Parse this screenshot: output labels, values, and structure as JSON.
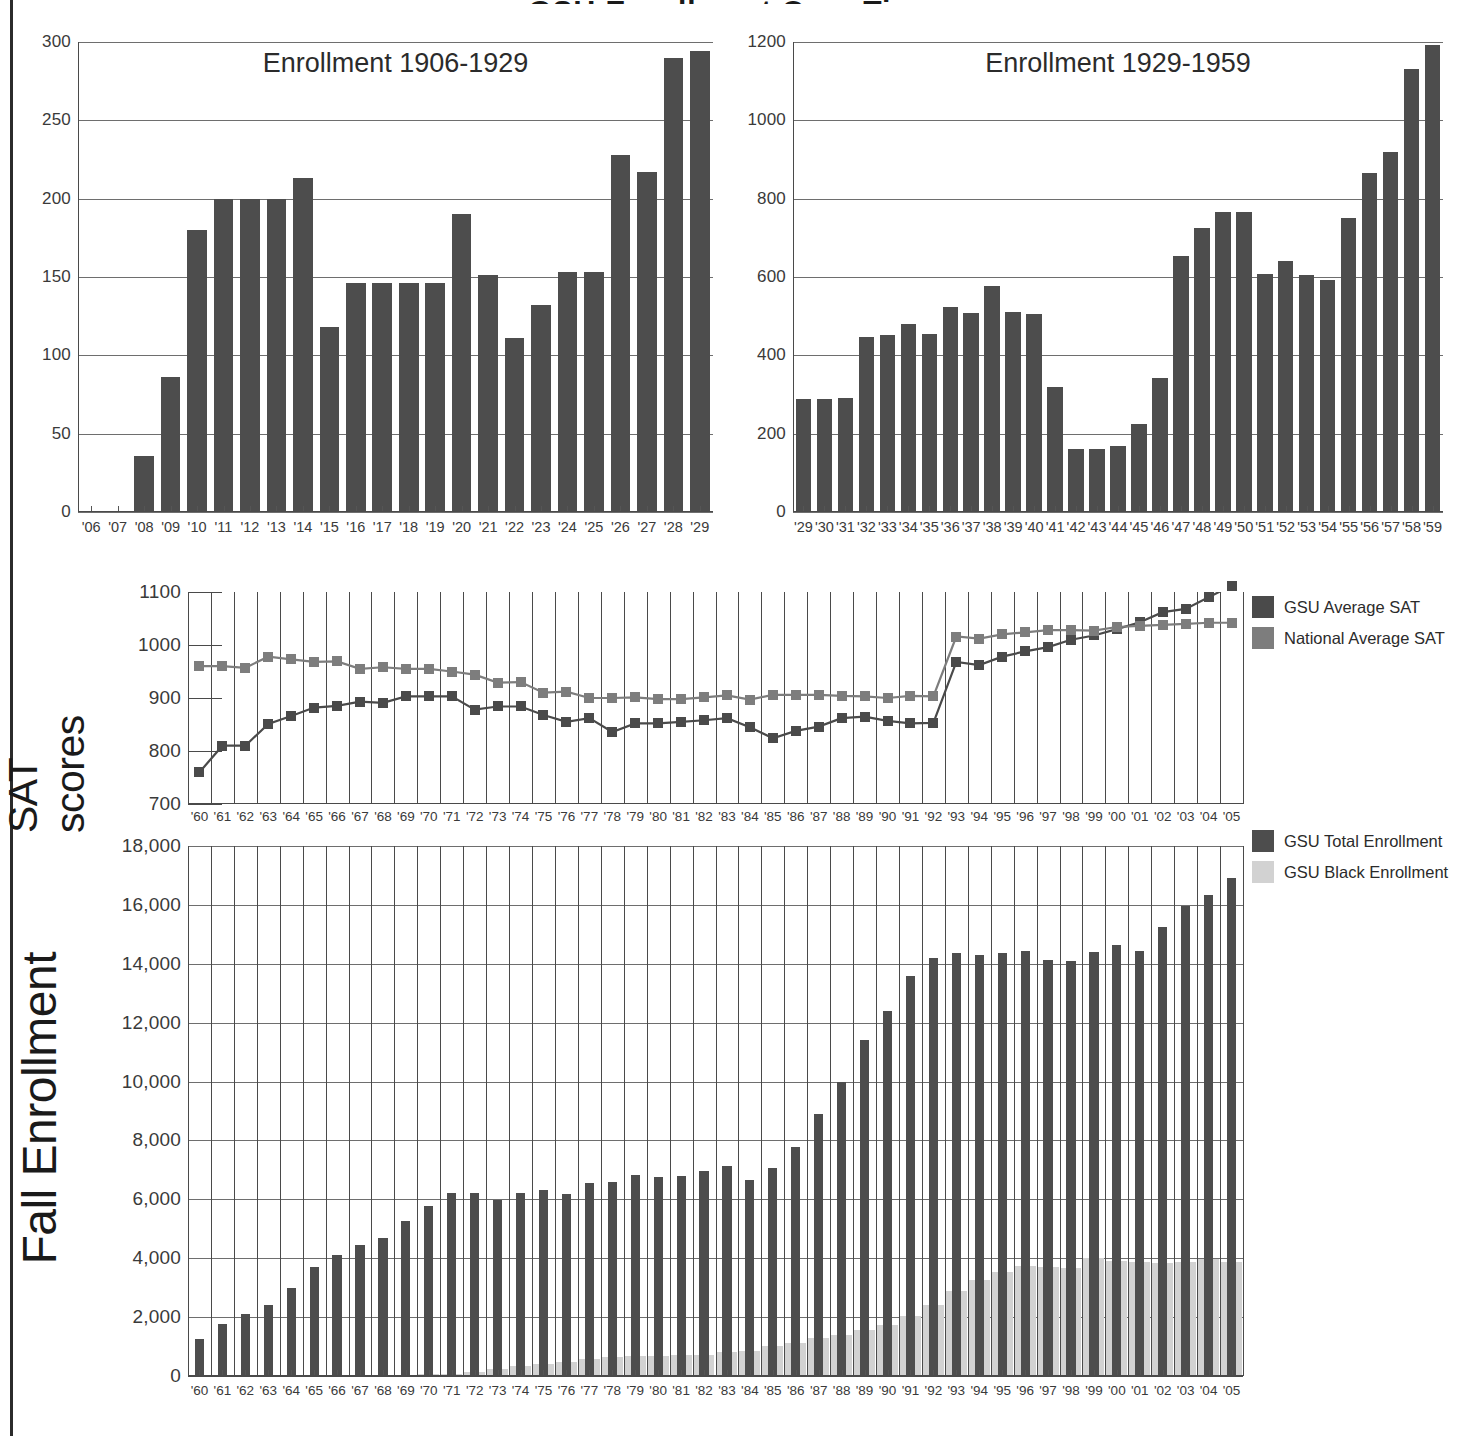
{
  "page": {
    "header_title": "GSU Enrollment Over Time"
  },
  "chart_data": [
    {
      "id": "enrollment_1906_1929",
      "type": "bar",
      "title": "Enrollment 1906-1929",
      "xlabel": "",
      "ylabel": "",
      "ylim": [
        0,
        300
      ],
      "yticks": [
        0,
        50,
        100,
        150,
        200,
        250,
        300
      ],
      "ytick_labels": [
        "0",
        "50",
        "100",
        "150",
        "200",
        "250",
        "300"
      ],
      "grid": true,
      "categories": [
        "'06",
        "'07",
        "'08",
        "'09",
        "'10",
        "'11",
        "'12",
        "'13",
        "'14",
        "'15",
        "'16",
        "'17",
        "'18",
        "'19",
        "'20",
        "'21",
        "'22",
        "'23",
        "'24",
        "'25",
        "'26",
        "'27",
        "'28",
        "'29"
      ],
      "values": [
        0,
        0,
        36,
        86,
        180,
        200,
        200,
        200,
        213,
        118,
        146,
        146,
        146,
        146,
        190,
        151,
        111,
        132,
        153,
        153,
        228,
        217,
        290,
        294
      ],
      "bar_color": "#4d4d4d"
    },
    {
      "id": "enrollment_1929_1959",
      "type": "bar",
      "title": "Enrollment 1929-1959",
      "xlabel": "",
      "ylabel": "",
      "ylim": [
        0,
        1200
      ],
      "yticks": [
        0,
        200,
        400,
        600,
        800,
        1000,
        1200
      ],
      "ytick_labels": [
        "0",
        "200",
        "400",
        "600",
        "800",
        "1000",
        "1200"
      ],
      "grid": true,
      "categories": [
        "'29",
        "'30",
        "'31",
        "'32",
        "'33",
        "'34",
        "'35",
        "'36",
        "'37",
        "'38",
        "'39",
        "'40",
        "'41",
        "'42",
        "'43",
        "'44",
        "'45",
        "'46",
        "'47",
        "'48",
        "'49",
        "'50",
        "'51",
        "'52",
        "'53",
        "'54",
        "'55",
        "'56",
        "'57",
        "'58",
        "'59"
      ],
      "values": [
        288,
        288,
        292,
        448,
        452,
        480,
        454,
        524,
        508,
        578,
        510,
        506,
        320,
        162,
        160,
        168,
        224,
        342,
        654,
        726,
        766,
        766,
        608,
        642,
        604,
        592,
        750,
        866,
        920,
        1130,
        1192
      ],
      "bar_color": "#4d4d4d"
    },
    {
      "id": "sat_scores",
      "type": "line",
      "title": "",
      "xlabel": "",
      "ylabel": "SAT scores",
      "ylim": [
        700,
        1100
      ],
      "yticks": [
        700,
        800,
        900,
        1000,
        1100
      ],
      "ytick_labels": [
        "700",
        "800",
        "900",
        "1000",
        "1100"
      ],
      "grid": true,
      "legend_position": "right",
      "categories": [
        "'60",
        "'61",
        "'62",
        "'63",
        "'64",
        "'65",
        "'66",
        "'67",
        "'68",
        "'69",
        "'70",
        "'71",
        "'72",
        "'73",
        "'74",
        "'75",
        "'76",
        "'77",
        "'78",
        "'79",
        "'80",
        "'81",
        "'82",
        "'83",
        "'84",
        "'85",
        "'86",
        "'87",
        "'88",
        "'89",
        "'90",
        "'91",
        "'92",
        "'93",
        "'94",
        "'95",
        "'96",
        "'97",
        "'98",
        "'99",
        "'00",
        "'01",
        "'02",
        "'03",
        "'04",
        "'05"
      ],
      "series": [
        {
          "name": "GSU Average SAT",
          "color": "#4a4a4a",
          "values": [
            760,
            810,
            810,
            851,
            866,
            882,
            885,
            893,
            891,
            903,
            903,
            903,
            878,
            884,
            884,
            868,
            855,
            862,
            836,
            852,
            852,
            855,
            858,
            862,
            845,
            824,
            838,
            846,
            862,
            865,
            857,
            852,
            853,
            968,
            962,
            978,
            988,
            996,
            1010,
            1018,
            1030,
            1043,
            1062,
            1068,
            1090,
            1112
          ]
        },
        {
          "name": "National Average SAT",
          "color": "#7d7d7d",
          "values": [
            960,
            960,
            957,
            978,
            973,
            968,
            969,
            955,
            958,
            955,
            955,
            950,
            944,
            929,
            930,
            910,
            912,
            900,
            900,
            901,
            898,
            898,
            901,
            905,
            897,
            906,
            906,
            906,
            904,
            903,
            900,
            904,
            903,
            1016,
            1012,
            1020,
            1024,
            1028,
            1028,
            1027,
            1034,
            1036,
            1038,
            1040,
            1042,
            1042
          ]
        }
      ]
    },
    {
      "id": "fall_enrollment",
      "type": "bar",
      "title": "",
      "xlabel": "",
      "ylabel": "Fall Enrollment",
      "ylim": [
        0,
        18000
      ],
      "yticks": [
        0,
        2000,
        4000,
        6000,
        8000,
        10000,
        12000,
        14000,
        16000,
        18000
      ],
      "ytick_labels": [
        "0",
        "2,000",
        "4,000",
        "6,000",
        "8,000",
        "10,000",
        "12,000",
        "14,000",
        "16,000",
        "18,000"
      ],
      "grid": true,
      "legend_position": "right",
      "categories": [
        "'60",
        "'61",
        "'62",
        "'63",
        "'64",
        "'65",
        "'66",
        "'67",
        "'68",
        "'69",
        "'70",
        "'71",
        "'72",
        "'73",
        "'74",
        "'75",
        "'76",
        "'77",
        "'78",
        "'79",
        "'80",
        "'81",
        "'82",
        "'83",
        "'84",
        "'85",
        "'86",
        "'87",
        "'88",
        "'89",
        "'90",
        "'91",
        "'92",
        "'93",
        "'94",
        "'95",
        "'96",
        "'97",
        "'98",
        "'99",
        "'00",
        "'01",
        "'02",
        "'03",
        "'04",
        "'05"
      ],
      "series": [
        {
          "name": "GSU Total Enrollment",
          "color": "#4d4d4d",
          "values": [
            1250,
            1750,
            2120,
            2400,
            2980,
            3700,
            4100,
            4450,
            4700,
            5250,
            5780,
            6200,
            6220,
            5980,
            6200,
            6330,
            6180,
            6550,
            6600,
            6820,
            6750,
            6800,
            6950,
            7130,
            6650,
            7060,
            7780,
            8900,
            10000,
            11400,
            12400,
            13580,
            14180,
            14350,
            14300,
            14350,
            14450,
            14130,
            14100,
            14400,
            14630,
            14450,
            15250,
            15950,
            16320,
            16900
          ]
        },
        {
          "name": "GSU Black Enrollment",
          "color": "#d2d2d2",
          "values": [
            0,
            0,
            0,
            0,
            0,
            0,
            0,
            0,
            0,
            0,
            60,
            80,
            150,
            230,
            330,
            400,
            480,
            590,
            640,
            680,
            680,
            700,
            720,
            820,
            860,
            1020,
            1120,
            1280,
            1380,
            1560,
            1720,
            2050,
            2420,
            2900,
            3250,
            3520,
            3730,
            3700,
            3680,
            4020,
            3920,
            3870,
            3830,
            3870,
            3960,
            3860
          ]
        }
      ]
    }
  ]
}
